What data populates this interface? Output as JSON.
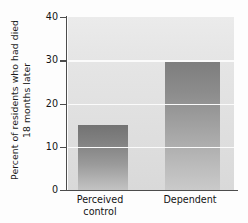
{
  "chart_data": {
    "type": "bar",
    "title": "",
    "xlabel": "",
    "ylabel": "Percent of residents who had died\n18 months later",
    "categories": [
      "Perceived\ncontrol",
      "Dependent"
    ],
    "values": [
      15,
      30
    ],
    "ylim": [
      0,
      40
    ],
    "yticks": [
      0,
      10,
      20,
      30,
      40
    ],
    "ytick_labels": [
      "0",
      "10",
      "20",
      "30",
      "40"
    ],
    "grid": "horizontal-white-gridlines-at-10-20-30",
    "legend": "none",
    "series": [
      {
        "name": "Percent of residents who had died 18 months later",
        "values": [
          15,
          30
        ]
      }
    ],
    "colors": {
      "bar_top": "#737373",
      "bar_bottom": "#c3c3c3",
      "plot_background": "#e4e4e4",
      "gridline": "#fbfbfb",
      "axis": "#4c4c4c",
      "text": "#141414",
      "figure_background": "#fdfdfd"
    }
  }
}
